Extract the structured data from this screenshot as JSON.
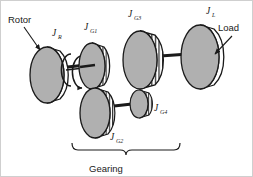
{
  "figure": {
    "background_color": "#ffffff",
    "line_color": "#1a1a1a",
    "disk_face_color": "#b0b0b0",
    "disk_rim_color": "#ffffff",
    "gear_tooth_color": "#ffffff",
    "width": 253,
    "height": 177
  },
  "labels": {
    "rotor": "Rotor",
    "load": "Load",
    "gearing": "Gearing",
    "j_rotor_symbol": "J",
    "j_rotor_sub": "R",
    "j_g1_symbol": "J",
    "j_g1_sub": "G1",
    "j_g2_symbol": "J",
    "j_g2_sub": "G2",
    "j_g3_symbol": "J",
    "j_g3_sub": "G3",
    "j_g4_symbol": "J",
    "j_g4_sub": "G4",
    "j_load_symbol": "J",
    "j_load_sub": "L"
  },
  "components": [
    {
      "name": "rotor-disk",
      "label": "Rotor",
      "inertia": "J_R",
      "type": "disk",
      "cx": 47,
      "cy": 75,
      "rx": 17,
      "ry": 28
    },
    {
      "name": "gear-g1",
      "label": "J_G1",
      "inertia": "J_G1",
      "type": "gear",
      "cx": 92,
      "cy": 66,
      "rx": 13,
      "ry": 23
    },
    {
      "name": "gear-g2",
      "label": "J_G2",
      "inertia": "J_G2",
      "type": "gear",
      "cx": 95,
      "cy": 113,
      "rx": 15,
      "ry": 25
    },
    {
      "name": "gear-g3",
      "label": "J_G3",
      "inertia": "J_G3",
      "type": "gear",
      "cx": 140,
      "cy": 60,
      "rx": 17,
      "ry": 29
    },
    {
      "name": "gear-g4",
      "label": "J_G4",
      "inertia": "J_G4",
      "type": "gear",
      "cx": 139,
      "cy": 104,
      "rx": 9,
      "ry": 14
    },
    {
      "name": "load-disk",
      "label": "Load",
      "inertia": "J_L",
      "type": "disk",
      "cx": 200,
      "cy": 57,
      "rx": 19,
      "ry": 32
    }
  ],
  "annotations": {
    "rotation_arrow": "curved-rotation-arrow",
    "brace_span": "Gearing",
    "leader_rotor": "arrow from Rotor text to rotor disk",
    "leader_load": "arrow from Load text to load disk"
  }
}
